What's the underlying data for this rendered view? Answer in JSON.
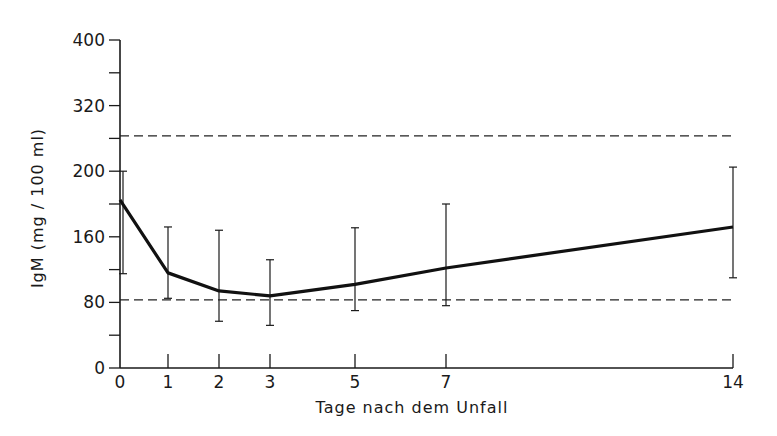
{
  "chart_data": {
    "type": "line",
    "title": "",
    "xlabel": "Tage nach dem Unfall",
    "ylabel": "IgM (mg / 100 ml)",
    "x": [
      0,
      1,
      2,
      3,
      5,
      7,
      14
    ],
    "x_tick_labels": [
      "0",
      "1",
      "2",
      "3",
      "5",
      "7",
      "14"
    ],
    "y_ticks": [
      0,
      40,
      80,
      120,
      160,
      200,
      240,
      280,
      320,
      360,
      400
    ],
    "y_tick_labels": [
      {
        "value": 0,
        "label": "0"
      },
      {
        "value": 80,
        "label": "80"
      },
      {
        "value": 160,
        "label": "160"
      },
      {
        "value": 240,
        "label": "200"
      },
      {
        "value": 320,
        "label": "320"
      },
      {
        "value": 400,
        "label": "400"
      }
    ],
    "ylim": [
      0,
      400
    ],
    "grid": false,
    "legend": null,
    "series": [
      {
        "name": "IgM mean",
        "values": [
          205,
          116,
          94,
          88,
          102,
          122,
          172
        ],
        "error_upper": [
          240,
          172,
          168,
          132,
          171,
          200,
          245
        ],
        "error_lower": [
          115,
          85,
          57,
          52,
          70,
          76,
          110
        ]
      }
    ],
    "reference_lines": [
      {
        "name": "upper-normal-limit",
        "value": 283,
        "style": "dashed"
      },
      {
        "name": "lower-normal-limit",
        "value": 83,
        "style": "dashed"
      }
    ]
  }
}
